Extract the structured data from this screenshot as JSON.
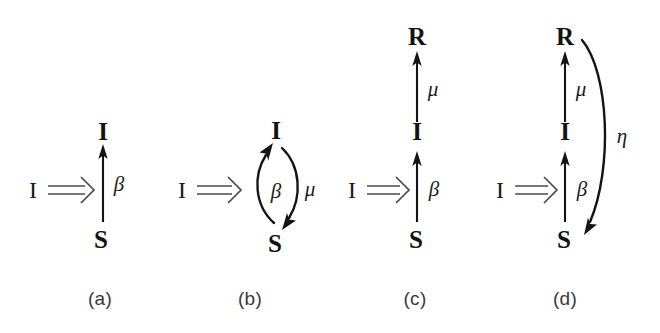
{
  "figure": {
    "background_color": "#ffffff",
    "ink_color": "#141414",
    "panel_count": 4
  },
  "panels": [
    {
      "id": "a",
      "caption": "(a)",
      "model": "SI",
      "source_node": "I",
      "source_arrow": "double-rightwards-arrow",
      "nodes": [
        {
          "label": "S",
          "role": "susceptible"
        },
        {
          "label": "I",
          "role": "infected"
        }
      ],
      "edges": [
        {
          "from": "S",
          "to": "I",
          "label": "β",
          "label_name": "beta",
          "shape": "straight-up"
        }
      ]
    },
    {
      "id": "b",
      "caption": "(b)",
      "model": "SIS",
      "source_node": "I",
      "source_arrow": "double-rightwards-arrow",
      "nodes": [
        {
          "label": "S",
          "role": "susceptible"
        },
        {
          "label": "I",
          "role": "infected"
        }
      ],
      "edges": [
        {
          "from": "S",
          "to": "I",
          "label": "β",
          "label_name": "beta",
          "shape": "curve-left"
        },
        {
          "from": "I",
          "to": "S",
          "label": "μ",
          "label_name": "mu",
          "shape": "curve-right"
        }
      ]
    },
    {
      "id": "c",
      "caption": "(c)",
      "model": "SIR",
      "source_node": "I",
      "source_arrow": "double-rightwards-arrow",
      "nodes": [
        {
          "label": "S",
          "role": "susceptible"
        },
        {
          "label": "I",
          "role": "infected"
        },
        {
          "label": "R",
          "role": "recovered"
        }
      ],
      "edges": [
        {
          "from": "S",
          "to": "I",
          "label": "β",
          "label_name": "beta",
          "shape": "straight-up"
        },
        {
          "from": "I",
          "to": "R",
          "label": "μ",
          "label_name": "mu",
          "shape": "straight-up"
        }
      ]
    },
    {
      "id": "d",
      "caption": "(d)",
      "model": "SIRS",
      "source_node": "I",
      "source_arrow": "double-rightwards-arrow",
      "nodes": [
        {
          "label": "S",
          "role": "susceptible"
        },
        {
          "label": "I",
          "role": "infected"
        },
        {
          "label": "R",
          "role": "recovered"
        }
      ],
      "edges": [
        {
          "from": "S",
          "to": "I",
          "label": "β",
          "label_name": "beta",
          "shape": "straight-up"
        },
        {
          "from": "I",
          "to": "R",
          "label": "μ",
          "label_name": "mu",
          "shape": "straight-up"
        },
        {
          "from": "R",
          "to": "S",
          "label": "η",
          "label_name": "eta",
          "shape": "long-curve-right"
        }
      ]
    }
  ]
}
